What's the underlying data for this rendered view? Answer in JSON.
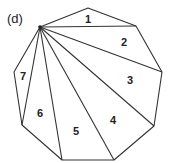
{
  "panel_label": "(d)",
  "diagram": {
    "type": "polygon-triangulation",
    "shape": "nonagon",
    "apex_vertex": 0,
    "vertices": [
      [
        40,
        27
      ],
      [
        88,
        8
      ],
      [
        136,
        26
      ],
      [
        162,
        72
      ],
      [
        154,
        126
      ],
      [
        114,
        160
      ],
      [
        62,
        160
      ],
      [
        22,
        125
      ],
      [
        14,
        72
      ]
    ],
    "triangles": [
      {
        "label": "1",
        "v": [
          0,
          1,
          2
        ],
        "pos": [
          88,
          19
        ]
      },
      {
        "label": "2",
        "v": [
          0,
          2,
          3
        ],
        "pos": [
          124,
          42
        ]
      },
      {
        "label": "3",
        "v": [
          0,
          3,
          4
        ],
        "pos": [
          130,
          80
        ]
      },
      {
        "label": "4",
        "v": [
          0,
          4,
          5
        ],
        "pos": [
          113,
          120
        ]
      },
      {
        "label": "5",
        "v": [
          0,
          5,
          6
        ],
        "pos": [
          76,
          131
        ]
      },
      {
        "label": "6",
        "v": [
          0,
          6,
          7
        ],
        "pos": [
          40,
          113
        ]
      },
      {
        "label": "7",
        "v": [
          0,
          7,
          8
        ],
        "pos": [
          23,
          76
        ]
      }
    ],
    "stroke_color": "#333333"
  }
}
